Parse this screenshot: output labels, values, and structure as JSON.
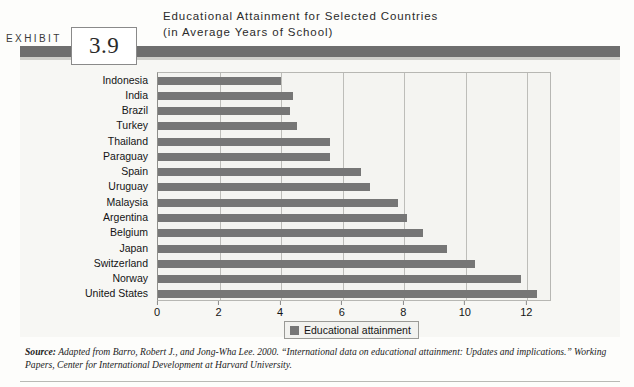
{
  "exhibit": {
    "label": "EXHIBIT",
    "number": "3.9"
  },
  "title": {
    "line1": "Educational Attainment for Selected Countries",
    "line2": "(in Average Years of School)"
  },
  "legend": {
    "swatch_icon": "legend-swatch-icon",
    "label": "Educational attainment"
  },
  "source": {
    "label": "Source:",
    "text": " Adapted from Barro, Robert J., and Jong-Wha Lee. 2000. “International data on educational attainment: Updates and implications.” Working Papers, Center for International Development at Harvard University."
  },
  "colors": {
    "bar": "#767676",
    "header_bar": "#6e6e6e",
    "panel_bg": "#f7f7f4",
    "plot_bg": "#f4f4f1",
    "gridline": "#bdbdb9"
  },
  "chart_data": {
    "type": "bar",
    "orientation": "horizontal",
    "title": "Educational Attainment for Selected Countries (in Average Years of School)",
    "xlabel": "",
    "ylabel": "",
    "xlim": [
      0,
      12.8
    ],
    "xticks": [
      0,
      2,
      4,
      6,
      8,
      10,
      12
    ],
    "xtick_labels": [
      "0",
      "2",
      "4",
      "6",
      "8",
      "10",
      "12"
    ],
    "grid": true,
    "grid_axis": "x",
    "legend_position": "bottom",
    "series": [
      {
        "name": "Educational attainment",
        "color": "#767676",
        "values": [
          4.0,
          4.4,
          4.3,
          4.5,
          5.6,
          5.6,
          6.6,
          6.9,
          7.8,
          8.1,
          8.6,
          9.4,
          10.3,
          11.8,
          12.3
        ]
      }
    ],
    "categories": [
      "Indonesia",
      "India",
      "Brazil",
      "Turkey",
      "Thailand",
      "Paraguay",
      "Spain",
      "Uruguay",
      "Malaysia",
      "Argentina",
      "Belgium",
      "Japan",
      "Switzerland",
      "Norway",
      "United States"
    ]
  }
}
